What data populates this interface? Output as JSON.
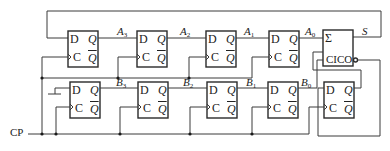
{
  "diagram": {
    "clock_label": "CP",
    "sum_label": "S",
    "adder": {
      "sum_symbol": "Σ",
      "carry_label": "CICO"
    },
    "flipflop_pins": {
      "d": "D",
      "c": "C",
      "q": "Q",
      "qbar": "Q"
    },
    "register_a": [
      {
        "name": "A",
        "index": "3"
      },
      {
        "name": "A",
        "index": "2"
      },
      {
        "name": "A",
        "index": "1"
      },
      {
        "name": "A",
        "index": "0"
      }
    ],
    "register_b": [
      {
        "name": "B",
        "index": "3"
      },
      {
        "name": "B",
        "index": "2"
      },
      {
        "name": "B",
        "index": "1"
      },
      {
        "name": "B",
        "index": "0"
      }
    ],
    "colors": {
      "line": "#2a2a2a",
      "background": "#ffffff"
    }
  }
}
